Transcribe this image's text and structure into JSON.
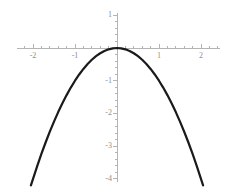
{
  "chart_data": {
    "type": "line",
    "title": "",
    "subtitle": "",
    "xlabel": "",
    "ylabel": "",
    "function": "y = -x^2",
    "xlim": [
      -2.45,
      2.45
    ],
    "ylim": [
      -4.05,
      1.05
    ],
    "grid": false,
    "legend": false,
    "legend_position": "none",
    "xticks": [
      -2,
      -1,
      1,
      2
    ],
    "xtick_labels": [
      "-2",
      "-1",
      "1",
      "2"
    ],
    "yticks": [
      1,
      -1,
      -2,
      -3,
      -4
    ],
    "ytick_labels": [
      "1",
      "-1",
      "-2",
      "-3",
      "-4"
    ],
    "minor_tick_step": 0.2,
    "series": [
      {
        "name": "y = -x^2",
        "color": "#1a1a1a",
        "line_width": 2.2,
        "x": [
          -2.05,
          -1.9,
          -1.8,
          -1.7,
          -1.6,
          -1.5,
          -1.4,
          -1.3,
          -1.2,
          -1.1,
          -1.0,
          -0.9,
          -0.8,
          -0.7,
          -0.6,
          -0.5,
          -0.4,
          -0.3,
          -0.2,
          -0.1,
          0.0,
          0.1,
          0.2,
          0.3,
          0.4,
          0.5,
          0.6,
          0.7,
          0.8,
          0.9,
          1.0,
          1.1,
          1.2,
          1.3,
          1.4,
          1.5,
          1.6,
          1.7,
          1.8,
          1.9,
          2.05
        ],
        "y": [
          -4.2,
          -3.61,
          -3.24,
          -2.89,
          -2.56,
          -2.25,
          -1.96,
          -1.69,
          -1.44,
          -1.21,
          -1.0,
          -0.81,
          -0.64,
          -0.49,
          -0.36,
          -0.25,
          -0.16,
          -0.09,
          -0.04,
          -0.01,
          0.0,
          -0.01,
          -0.04,
          -0.09,
          -0.16,
          -0.25,
          -0.36,
          -0.49,
          -0.64,
          -0.81,
          -1.0,
          -1.21,
          -1.44,
          -1.69,
          -1.96,
          -2.25,
          -2.56,
          -2.89,
          -3.24,
          -3.61,
          -4.2
        ]
      }
    ],
    "axis_color": "#b4b4b4",
    "tick_label_color": "#8e8e8e",
    "background_color": "#ffffff"
  },
  "axes": {
    "x_axis_name": "horizontal-axis",
    "y_axis_name": "vertical-axis"
  }
}
